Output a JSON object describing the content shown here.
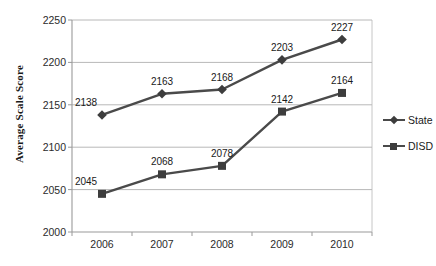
{
  "chart_data": {
    "type": "line",
    "title": "",
    "xlabel": "",
    "ylabel": "Average Scale Score",
    "categories": [
      "2006",
      "2007",
      "2008",
      "2009",
      "2010"
    ],
    "ylim": [
      2000,
      2250
    ],
    "yticks": [
      2000,
      2050,
      2100,
      2150,
      2200,
      2250
    ],
    "grid": true,
    "legend_position": "right",
    "series": [
      {
        "name": "State",
        "marker": "diamond",
        "color": "#4a4a4a",
        "values": [
          2138,
          2163,
          2168,
          2203,
          2227
        ],
        "labels": [
          "2138",
          "2163",
          "2168",
          "2203",
          "2227"
        ]
      },
      {
        "name": "DISD",
        "marker": "square",
        "color": "#4a4a4a",
        "values": [
          2045,
          2068,
          2078,
          2142,
          2164
        ],
        "labels": [
          "2045",
          "2068",
          "2078",
          "2142",
          "2164"
        ]
      }
    ]
  },
  "legend": {
    "items": [
      {
        "label": "State",
        "marker": "diamond"
      },
      {
        "label": "DISD",
        "marker": "square"
      }
    ]
  },
  "axes": {
    "y_title": "Average Scale Score",
    "y_tick_labels": [
      "2250",
      "2200",
      "2150",
      "2100",
      "2050",
      "2000"
    ],
    "x_tick_labels": [
      "2006",
      "2007",
      "2008",
      "2009",
      "2010"
    ]
  },
  "colors": {
    "line": "#4a4a4a",
    "marker": "#3d3d3d",
    "grid": "#b8b8b8",
    "axis": "#9a9a9a",
    "text": "#1a1a1a",
    "background": "#ffffff"
  }
}
